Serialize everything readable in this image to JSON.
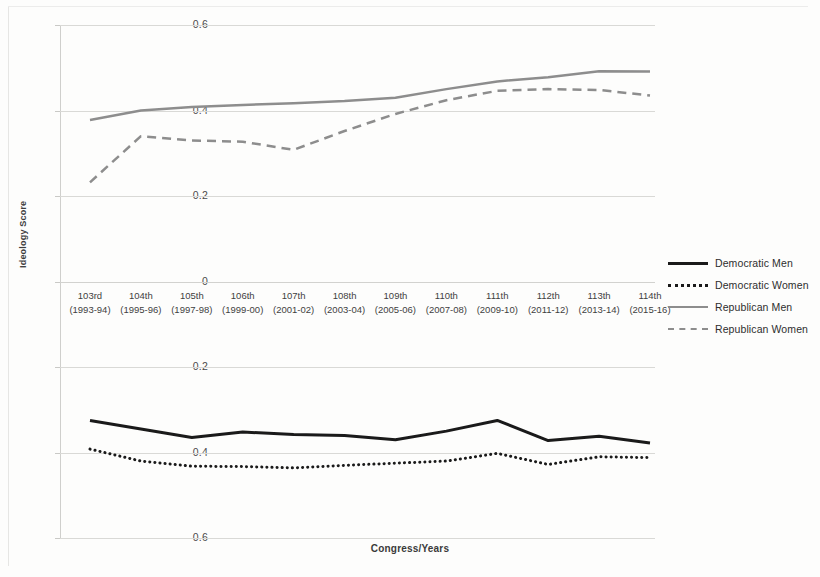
{
  "chart_data": {
    "type": "line",
    "title": "",
    "xlabel": "Congress/Years",
    "ylabel": "Ideology Score",
    "ylim": [
      -0.6,
      0.6
    ],
    "ytick_step": 0.2,
    "yticks": [
      "0.6",
      "0.4",
      "0.2",
      "0",
      "-0.2",
      "-0.4",
      "-0.6"
    ],
    "ytick_values": [
      0.6,
      0.4,
      0.2,
      0,
      -0.2,
      -0.4,
      -0.6
    ],
    "grid": true,
    "legend_position": "right",
    "categories": [
      "103rd",
      "104th",
      "105th",
      "106th",
      "107th",
      "108th",
      "109th",
      "110th",
      "111th",
      "112th",
      "113th",
      "114th"
    ],
    "category_years": [
      "(1993-94)",
      "(1995-96)",
      "(1997-98)",
      "(1999-00)",
      "(2001-02)",
      "(2003-04)",
      "(2005-06)",
      "(2007-08)",
      "(2009-10)",
      "(2011-12)",
      "(2013-14)",
      "(2015-16)"
    ],
    "series": [
      {
        "name": "Democratic Men",
        "style": "solid",
        "color": "#1a1a1a",
        "width": 3,
        "values": [
          -0.325,
          -0.345,
          -0.365,
          -0.352,
          -0.358,
          -0.36,
          -0.37,
          -0.35,
          -0.325,
          -0.372,
          -0.362,
          -0.378
        ]
      },
      {
        "name": "Democratic Women",
        "style": "dotted",
        "color": "#1a1a1a",
        "width": 3,
        "values": [
          -0.392,
          -0.42,
          -0.432,
          -0.433,
          -0.436,
          -0.43,
          -0.425,
          -0.42,
          -0.402,
          -0.428,
          -0.41,
          -0.412
        ]
      },
      {
        "name": "Republican Men",
        "style": "solid",
        "color": "#8d8d8d",
        "width": 2.5,
        "values": [
          0.378,
          0.4,
          0.408,
          0.413,
          0.417,
          0.422,
          0.43,
          0.45,
          0.468,
          0.478,
          0.492,
          0.491
        ]
      },
      {
        "name": "Republican Women",
        "style": "dashed",
        "color": "#8d8d8d",
        "width": 2.5,
        "values": [
          0.232,
          0.34,
          0.33,
          0.327,
          0.308,
          0.352,
          0.392,
          0.424,
          0.446,
          0.45,
          0.448,
          0.435
        ]
      }
    ]
  },
  "legend": {
    "items": [
      {
        "label": "Democratic Men",
        "sample": "solid-black-line-sample"
      },
      {
        "label": "Democratic Women",
        "sample": "dotted-black-line-sample"
      },
      {
        "label": "Republican Men",
        "sample": "solid-gray-line-sample"
      },
      {
        "label": "Republican Women",
        "sample": "dashed-gray-line-sample"
      }
    ]
  }
}
